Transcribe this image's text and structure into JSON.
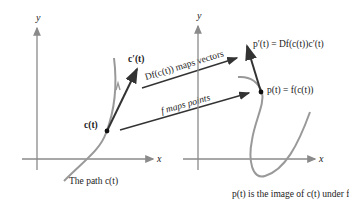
{
  "left_plot": {
    "x_axis_label": "x",
    "y_axis_label": "y",
    "tangent_label": "c′(t)",
    "point_label": "c(t)",
    "caption": "The path c(t)"
  },
  "right_plot": {
    "x_axis_label": "x",
    "y_axis_label": "y",
    "tangent_label": "p′(t) = Df(c(t))c′(t)",
    "point_label": "p(t) = f(c(t))",
    "caption": "p(t) is the image of c(t) under f"
  },
  "arrows": {
    "vectors_label": "Df(c(t)) maps vectors",
    "points_label": "f maps points"
  },
  "colors": {
    "curve": "#999999",
    "axis": "#8a8a8a",
    "vector": "#333333",
    "text": "#222222"
  }
}
